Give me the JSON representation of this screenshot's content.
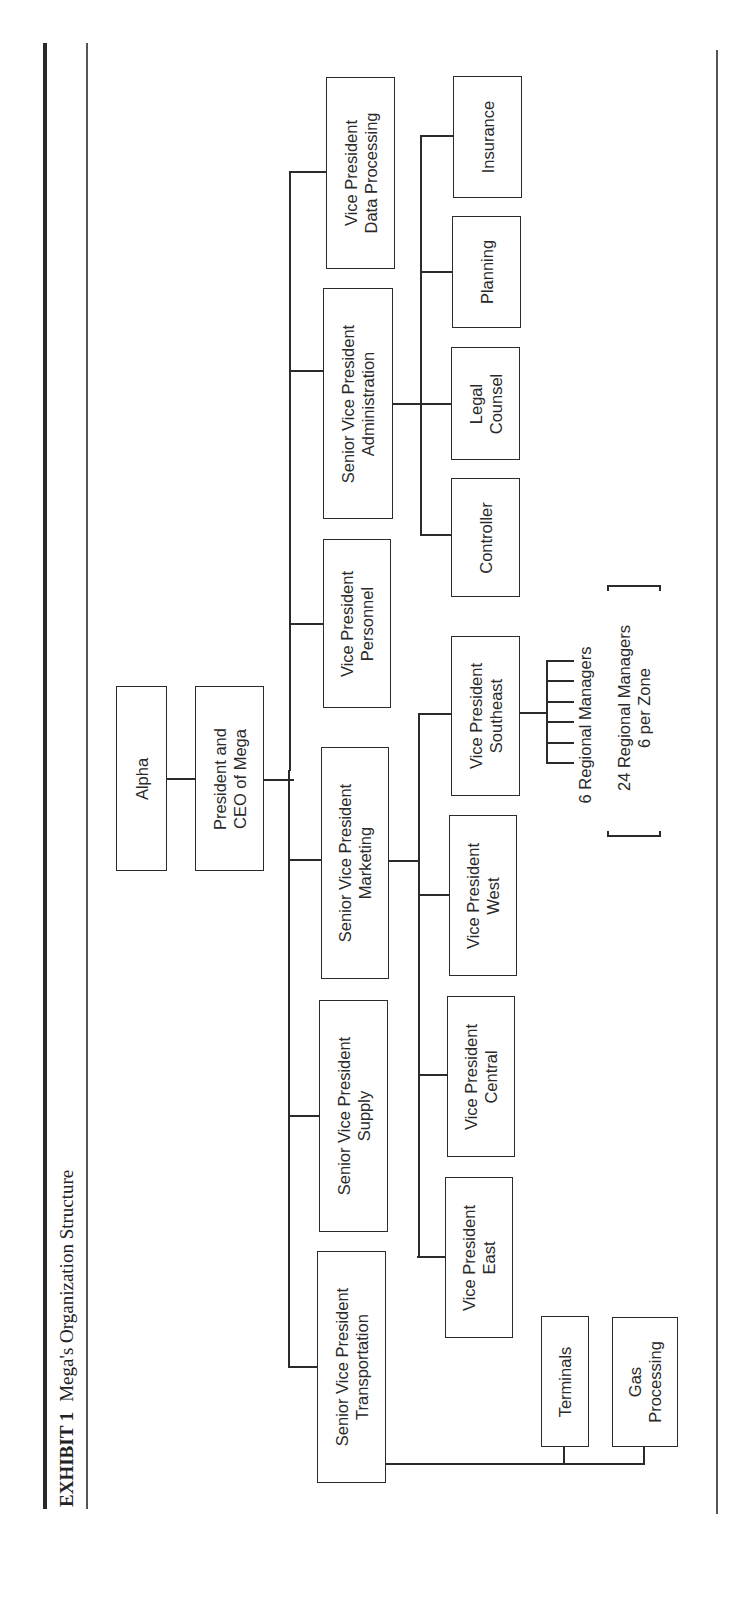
{
  "exhibit": {
    "label": "EXHIBIT 1",
    "title": "Mega's Organization Structure"
  },
  "org_chart": {
    "root": {
      "label": "Alpha"
    },
    "ceo": {
      "line1": "President and",
      "line2": "CEO of Mega"
    },
    "top_level": [
      {
        "id": "transportation",
        "line1": "Senior Vice President",
        "line2": "Transportation"
      },
      {
        "id": "supply",
        "line1": "Senior Vice President",
        "line2": "Supply"
      },
      {
        "id": "marketing",
        "line1": "Senior Vice President",
        "line2": "Marketing"
      },
      {
        "id": "personnel",
        "line1": "Vice President",
        "line2": "Personnel"
      },
      {
        "id": "administration",
        "line1": "Senior Vice President",
        "line2": "Administration"
      },
      {
        "id": "data_processing",
        "line1": "Vice President",
        "line2": "Data Processing"
      }
    ],
    "transportation_units": [
      {
        "line1": "Terminals",
        "line2": ""
      },
      {
        "line1": "Gas",
        "line2": "Processing"
      }
    ],
    "marketing_units": [
      {
        "line1": "Vice President",
        "line2": "East"
      },
      {
        "line1": "Vice President",
        "line2": "Central"
      },
      {
        "line1": "Vice President",
        "line2": "West"
      },
      {
        "line1": "Vice President",
        "line2": "Southeast"
      }
    ],
    "administration_units": [
      {
        "line1": "Controller",
        "line2": ""
      },
      {
        "line1": "Legal",
        "line2": "Counsel"
      },
      {
        "line1": "Planning",
        "line2": ""
      },
      {
        "line1": "Insurance",
        "line2": ""
      }
    ],
    "regional_note": {
      "count_label": "6 Regional Managers",
      "bracket_line1": "24 Regional Managers",
      "bracket_line2": "6 per Zone",
      "tick_count": 6
    }
  }
}
